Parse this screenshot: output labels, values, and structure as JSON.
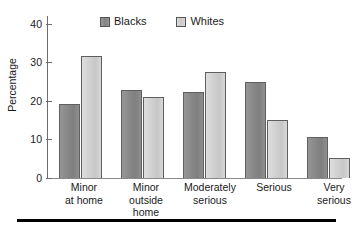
{
  "chart_data": {
    "type": "bar",
    "title": "",
    "xlabel": "",
    "ylabel": "Percentage",
    "ylim": [
      0,
      42
    ],
    "yticks": [
      0,
      10,
      20,
      30,
      40
    ],
    "ytick_labels": [
      "0",
      "10",
      "20",
      "30",
      "40"
    ],
    "grid": false,
    "legend_position": "top-center",
    "categories": [
      "Minor\nat home",
      "Minor\noutside\nhome",
      "Moderately\nserious",
      "Serious",
      "Very\nserious"
    ],
    "series": [
      {
        "name": "Blacks",
        "color": "#8c8c8c",
        "values": [
          19.2,
          22.9,
          22.3,
          24.9,
          10.5
        ]
      },
      {
        "name": "Whites",
        "color": "#d2d2d2",
        "values": [
          31.7,
          21.0,
          27.4,
          15.0,
          5.3
        ]
      }
    ]
  },
  "axis": {
    "y_label": "Percentage",
    "tick_0": "0",
    "tick_1": "10",
    "tick_2": "20",
    "tick_3": "30",
    "tick_4": "40"
  },
  "legend": {
    "entries": [
      {
        "label": "Blacks",
        "swatch": "dark-gray-swatch-icon"
      },
      {
        "label": "Whites",
        "swatch": "light-gray-swatch-icon"
      }
    ]
  },
  "categories": {
    "c0": "Minor\nat home",
    "c1": "Minor\noutside\nhome",
    "c2": "Moderately\nserious",
    "c3": "Serious",
    "c4": "Very\nserious"
  }
}
